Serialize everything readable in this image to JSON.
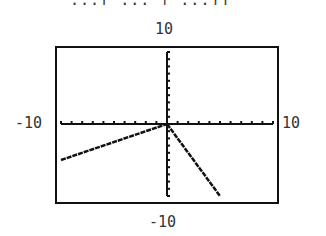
{
  "title_fragment": "...[ ...  | ...]]",
  "labels": {
    "y_max": "10",
    "y_min": "-10",
    "x_min": "-10",
    "x_max": "10"
  },
  "chart_data": {
    "type": "line",
    "title": "",
    "xlabel": "",
    "ylabel": "",
    "xlim": [
      -10,
      10
    ],
    "ylim": [
      -10,
      10
    ],
    "grid": false,
    "x_tick_step": 1,
    "y_tick_step": 1,
    "series": [
      {
        "name": "left piece",
        "x": [
          -10,
          0
        ],
        "y": [
          -5,
          0
        ]
      },
      {
        "name": "right piece",
        "x": [
          0,
          5
        ],
        "y": [
          0,
          -10
        ]
      }
    ]
  }
}
